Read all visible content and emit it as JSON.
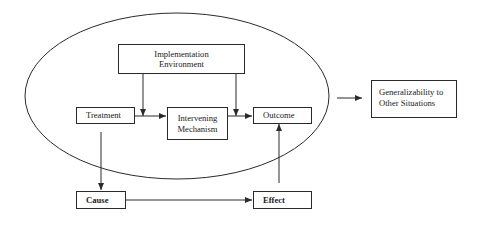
{
  "diagram": {
    "nodes": {
      "implementation_environment": {
        "label": "Implementation\nEnvironment",
        "line1": "Implementation",
        "line2": "Environment"
      },
      "treatment": {
        "label": "Treatment"
      },
      "intervening_mechanism": {
        "label": "Intervening\nMechanism",
        "line1": "Intervening",
        "line2": "Mechanism"
      },
      "outcome": {
        "label": "Outcome"
      },
      "generalizability": {
        "label": "Generalizability to\nOther Situations",
        "line1": "Generalizability to",
        "line2": "Other Situations"
      },
      "cause": {
        "label": "Cause"
      },
      "effect": {
        "label": "Effect"
      }
    },
    "edges": [
      {
        "from": "treatment",
        "to": "intervening_mechanism"
      },
      {
        "from": "intervening_mechanism",
        "to": "outcome"
      },
      {
        "from": "implementation_environment",
        "to": "treatment-intervening_mechanism edge"
      },
      {
        "from": "implementation_environment",
        "to": "intervening_mechanism-outcome edge"
      },
      {
        "from": "treatment",
        "to": "cause"
      },
      {
        "from": "cause",
        "to": "effect"
      },
      {
        "from": "effect",
        "to": "outcome"
      },
      {
        "from": "ellipse",
        "to": "generalizability"
      }
    ],
    "colors": {
      "line": "#2a2a2a",
      "background": "#ffffff"
    }
  }
}
